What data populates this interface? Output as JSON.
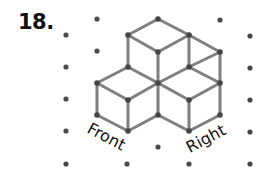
{
  "problem": {
    "number": "18."
  },
  "labels": {
    "front": {
      "text": "Front",
      "cx": 106,
      "cy": 137,
      "angle": 28
    },
    "right": {
      "text": "Right",
      "cx": 206,
      "cy": 139,
      "angle": -28
    }
  },
  "colors": {
    "background": "#ffffff",
    "grid_dot": "#4a4a4a",
    "edge": "#7f7f7f",
    "vertex": "#454545",
    "text": "#111111"
  },
  "isometric_grid": {
    "dot_radius": 2.6,
    "dots": [
      [
        66,
        35
      ],
      [
        66,
        67
      ],
      [
        66,
        99
      ],
      [
        66,
        131
      ],
      [
        66,
        164
      ],
      [
        97,
        19
      ],
      [
        97,
        51
      ],
      [
        127,
        164
      ],
      [
        158,
        147
      ],
      [
        189,
        164
      ],
      [
        220,
        20
      ],
      [
        250,
        36
      ],
      [
        250,
        68
      ],
      [
        250,
        100
      ],
      [
        250,
        132
      ],
      [
        250,
        164
      ]
    ]
  },
  "figure": {
    "cube_count": 4,
    "vertex_radius": 2.8,
    "edge_width": 3,
    "vertices": [
      [
        158,
        19
      ],
      [
        128,
        35
      ],
      [
        189,
        35
      ],
      [
        158,
        52
      ],
      [
        220,
        52
      ],
      [
        128,
        67
      ],
      [
        189,
        67
      ],
      [
        97,
        83
      ],
      [
        158,
        83
      ],
      [
        220,
        83
      ],
      [
        128,
        100
      ],
      [
        189,
        100
      ],
      [
        97,
        115
      ],
      [
        158,
        115
      ],
      [
        220,
        115
      ],
      [
        128,
        131
      ],
      [
        189,
        131
      ]
    ],
    "edges": [
      [
        [
          158,
          19
        ],
        [
          128,
          35
        ]
      ],
      [
        [
          158,
          19
        ],
        [
          189,
          35
        ]
      ],
      [
        [
          128,
          35
        ],
        [
          158,
          52
        ]
      ],
      [
        [
          189,
          35
        ],
        [
          158,
          52
        ]
      ],
      [
        [
          189,
          35
        ],
        [
          220,
          52
        ]
      ],
      [
        [
          128,
          35
        ],
        [
          128,
          67
        ]
      ],
      [
        [
          158,
          52
        ],
        [
          158,
          83
        ]
      ],
      [
        [
          189,
          35
        ],
        [
          189,
          67
        ]
      ],
      [
        [
          220,
          52
        ],
        [
          189,
          67
        ]
      ],
      [
        [
          220,
          52
        ],
        [
          220,
          83
        ]
      ],
      [
        [
          128,
          67
        ],
        [
          97,
          83
        ]
      ],
      [
        [
          128,
          67
        ],
        [
          158,
          83
        ]
      ],
      [
        [
          189,
          67
        ],
        [
          158,
          83
        ]
      ],
      [
        [
          189,
          67
        ],
        [
          220,
          83
        ]
      ],
      [
        [
          97,
          83
        ],
        [
          128,
          100
        ]
      ],
      [
        [
          158,
          83
        ],
        [
          128,
          100
        ]
      ],
      [
        [
          158,
          83
        ],
        [
          189,
          100
        ]
      ],
      [
        [
          220,
          83
        ],
        [
          189,
          100
        ]
      ],
      [
        [
          97,
          83
        ],
        [
          97,
          115
        ]
      ],
      [
        [
          128,
          100
        ],
        [
          128,
          131
        ]
      ],
      [
        [
          158,
          83
        ],
        [
          158,
          115
        ]
      ],
      [
        [
          189,
          100
        ],
        [
          189,
          131
        ]
      ],
      [
        [
          220,
          83
        ],
        [
          220,
          115
        ]
      ],
      [
        [
          97,
          115
        ],
        [
          128,
          131
        ]
      ],
      [
        [
          158,
          115
        ],
        [
          128,
          131
        ]
      ],
      [
        [
          158,
          115
        ],
        [
          189,
          131
        ]
      ],
      [
        [
          220,
          115
        ],
        [
          189,
          131
        ]
      ]
    ]
  }
}
